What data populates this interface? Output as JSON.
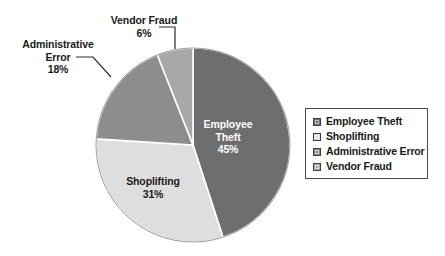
{
  "chart_data": {
    "type": "pie",
    "title": "",
    "subtitle": "",
    "xlabel": "",
    "ylabel": "",
    "grid": false,
    "legend_position": "right",
    "categories": [
      "Employee Theft",
      "Shoplifting",
      "Administrative Error",
      "Vendor Fraud"
    ],
    "values": [
      45,
      31,
      18,
      6
    ],
    "value_unit": "%",
    "start_angle_deg": 0,
    "direction": "clockwise",
    "colors": [
      "#6e6e6e",
      "#dedede",
      "#8d8d8d",
      "#a8a8a8"
    ],
    "slices": [
      {
        "label": "Employee Theft",
        "value": 45,
        "value_label": "45%",
        "color": "#6e6e6e",
        "label_placement": "inside",
        "label_color": "#ffffff"
      },
      {
        "label": "Shoplifting",
        "value": 31,
        "value_label": "31%",
        "color": "#dedede",
        "label_placement": "inside",
        "label_color": "#1a1a1a"
      },
      {
        "label": "Administrative Error",
        "value": 18,
        "value_label": "18%",
        "color": "#8d8d8d",
        "label_placement": "outside",
        "label_color": "#1a1a1a"
      },
      {
        "label": "Vendor Fraud",
        "value": 6,
        "value_label": "6%",
        "color": "#a8a8a8",
        "label_placement": "outside",
        "label_color": "#1a1a1a"
      }
    ]
  },
  "labels": {
    "vendor_fraud": {
      "name": "Vendor Fraud",
      "pct": "6%"
    },
    "administrative_error": {
      "name_line1": "Administrative",
      "name_line2": "Error",
      "pct": "18%"
    },
    "employee_theft": {
      "name_line1": "Employee",
      "name_line2": "Theft",
      "pct": "45%"
    },
    "shoplifting": {
      "name": "Shoplifting",
      "pct": "31%"
    }
  },
  "legend": {
    "items": [
      {
        "label": "Employee Theft",
        "color": "#6e6e6e"
      },
      {
        "label": "Shoplifting",
        "color": "#dedede"
      },
      {
        "label": "Administrative Error",
        "color": "#8d8d8d"
      },
      {
        "label": "Vendor Fraud",
        "color": "#a8a8a8"
      }
    ]
  }
}
